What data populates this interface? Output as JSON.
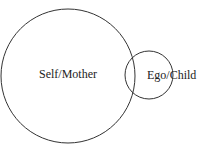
{
  "diagram": {
    "type": "overlapping-circles",
    "circles": [
      {
        "id": "self-mother",
        "label": "Self/Mother",
        "relative_size": "large"
      },
      {
        "id": "ego-child",
        "label": "Ego/Child",
        "relative_size": "small"
      }
    ],
    "stroke_color": "#333333",
    "background": "#ffffff"
  }
}
